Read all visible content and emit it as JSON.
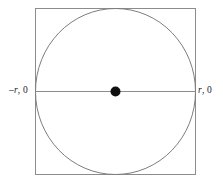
{
  "figure": {
    "kind": "geometry-diagram",
    "background_color": "#ffffff",
    "square": {
      "name": "bounding-square",
      "x": 35,
      "y": 8,
      "width": 161,
      "height": 167,
      "stroke_color": "#8c8c8c",
      "stroke_width": 1,
      "fill": "none"
    },
    "circle": {
      "name": "inscribed-circle",
      "cx": 115.5,
      "cy": 91.5,
      "rx": 80.5,
      "ry": 83.5,
      "stroke_color": "#7d7d7d",
      "stroke_width": 1,
      "fill": "none"
    },
    "diameter_line": {
      "name": "horizontal-diameter",
      "x1": 35,
      "y1": 91.5,
      "x2": 196,
      "y2": 91.5,
      "stroke_color": "#8c8c8c",
      "stroke_width": 1
    },
    "center_point": {
      "name": "center-point",
      "cx": 115.5,
      "cy": 91.5,
      "r": 5,
      "fill_color": "#101010"
    },
    "labels": {
      "left": {
        "sign": "–",
        "variable": "r",
        "coordinate": ", 0"
      },
      "right": {
        "sign": "",
        "variable": "r",
        "coordinate": ", 0"
      }
    }
  }
}
